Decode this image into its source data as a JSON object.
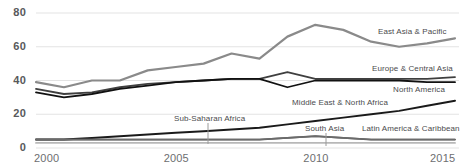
{
  "chart_data": {
    "type": "line",
    "title": "",
    "xlabel": "",
    "ylabel": "",
    "xlim": [
      2000,
      2015
    ],
    "ylim": [
      0,
      80
    ],
    "grid": true,
    "legend_position": "inline-right",
    "yticks": [
      0,
      20,
      40,
      60,
      80
    ],
    "xticks": [
      2000,
      2005,
      2010,
      2015
    ],
    "x": [
      2000,
      2001,
      2002,
      2003,
      2004,
      2005,
      2006,
      2007,
      2008,
      2009,
      2010,
      2011,
      2012,
      2013,
      2014,
      2015
    ],
    "series": [
      {
        "name": "East Asia & Pacific",
        "color": "#8a8a8a",
        "width": 2.2,
        "values": [
          39,
          36,
          40,
          40,
          46,
          48,
          50,
          56,
          53,
          66,
          73,
          70,
          63,
          60,
          62,
          65
        ]
      },
      {
        "name": "Europe & Central Asia",
        "color": "#3f3f3f",
        "width": 1.8,
        "values": [
          35,
          32,
          33,
          36,
          38,
          39,
          40,
          41,
          41,
          45,
          41,
          41,
          41,
          41,
          41,
          42
        ]
      },
      {
        "name": "North America",
        "color": "#111111",
        "width": 1.8,
        "values": [
          33,
          30,
          32,
          35,
          37,
          39,
          40,
          41,
          41,
          36,
          40,
          40,
          40,
          40,
          39,
          39
        ]
      },
      {
        "name": "Middle East & North Africa",
        "color": "#1a1a1a",
        "width": 2.0,
        "values": [
          5,
          5,
          6,
          7,
          8,
          9,
          10,
          11,
          12,
          14,
          16,
          18,
          20,
          22,
          25,
          28
        ]
      },
      {
        "name": "Sub-Saharan Africa",
        "color": "#5a5a5a",
        "width": 1.8,
        "values": [
          5,
          5,
          5,
          5,
          5,
          5,
          5,
          5,
          5,
          6,
          7,
          6,
          5,
          5,
          5,
          5
        ]
      },
      {
        "name": "South Asia",
        "color": "#6b6b6b",
        "width": 1.6,
        "values": [
          5,
          5,
          5,
          5,
          5,
          5,
          5,
          5,
          5,
          6,
          7,
          6,
          5,
          5,
          5,
          5
        ]
      },
      {
        "name": "Latin America & Caribbean",
        "color": "#b8b8b8",
        "width": 1.8,
        "values": [
          3,
          3,
          3,
          3,
          3,
          3,
          3,
          3,
          3,
          3,
          3,
          3,
          3,
          3,
          3,
          3
        ]
      }
    ],
    "annotations": [
      {
        "text": "East Asia & Pacific",
        "x_px": 378,
        "y_px": 27,
        "leader": false
      },
      {
        "text": "Europe & Central Asia",
        "x_px": 372,
        "y_px": 64,
        "leader": false
      },
      {
        "text": "North America",
        "x_px": 393,
        "y_px": 85,
        "leader": false
      },
      {
        "text": "Middle East & North Africa",
        "x_px": 292,
        "y_px": 98,
        "leader": false
      },
      {
        "text": "Sub-Saharan Africa",
        "x_px": 174,
        "y_px": 114,
        "leader": true,
        "leader_x": 208,
        "leader_y1": 123,
        "leader_y2": 144
      },
      {
        "text": "South Asia",
        "x_px": 305,
        "y_px": 124,
        "leader": true,
        "leader_x": 326,
        "leader_y1": 133,
        "leader_y2": 146
      },
      {
        "text": "Latin America & Caribbean",
        "x_px": 362,
        "y_px": 124,
        "leader": false
      }
    ]
  },
  "axis": {
    "y_labels": [
      "80",
      "60",
      "40",
      "20",
      "0"
    ],
    "x_labels": [
      "2000",
      "2005",
      "2010",
      "2015"
    ],
    "grid_color": "#e3e3e3",
    "label_color": "#58595b"
  }
}
